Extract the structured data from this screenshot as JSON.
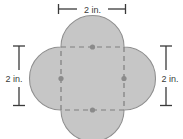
{
  "figure": {
    "name": "quatrefoil-composite-shape",
    "canvas": {
      "width": 183,
      "height": 139
    },
    "colors": {
      "shape_fill": "#c9c9c9",
      "shape_outline": "#8a8a8a",
      "dashed_line": "#8a8a8a",
      "center_dot": "#8a8a8a",
      "dimension_line": "#3a3a3a",
      "label_text": "#3a3a3a",
      "background": "#ffffff"
    },
    "square": {
      "left": 61,
      "top": 47,
      "right": 124,
      "bottom": 110,
      "side_px": 63,
      "stroke_dasharray": "5,4"
    },
    "lobe_radius_px": 31.5,
    "lobes": [
      {
        "name": "top-lobe",
        "center_x": 92.5,
        "center_y": 47
      },
      {
        "name": "right-lobe",
        "center_x": 124,
        "center_y": 78.5
      },
      {
        "name": "bottom-lobe",
        "center_x": 92.5,
        "center_y": 110
      },
      {
        "name": "left-lobe",
        "center_x": 61,
        "center_y": 78.5
      }
    ],
    "center_dots": [
      {
        "name": "dot-top",
        "cx": 92.5,
        "cy": 47,
        "r": 2.6
      },
      {
        "name": "dot-right",
        "cx": 124,
        "cy": 78.5,
        "r": 2.6
      },
      {
        "name": "dot-bottom",
        "cx": 92.5,
        "cy": 110,
        "r": 2.6
      },
      {
        "name": "dot-left",
        "cx": 61,
        "cy": 78.5,
        "r": 2.6
      }
    ]
  },
  "dimensions": {
    "top": {
      "label": "2 in.",
      "orientation": "horizontal",
      "x1": 58,
      "x2": 126,
      "y": 9,
      "text_x": 92,
      "text_y": 12
    },
    "left": {
      "label": "2 in.",
      "orientation": "vertical",
      "x": 19,
      "y1": 46,
      "y2": 106,
      "text_x": 14,
      "text_y": 79
    },
    "right": {
      "label": "2 in.",
      "orientation": "vertical",
      "x": 166,
      "y1": 46,
      "y2": 106,
      "text_x": 170,
      "text_y": 79
    }
  }
}
